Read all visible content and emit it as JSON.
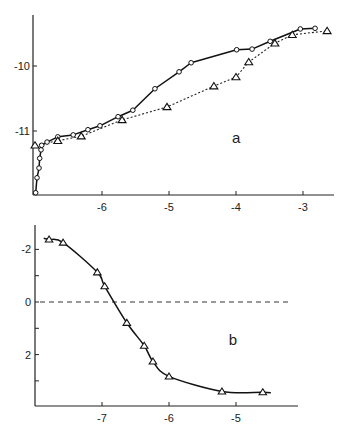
{
  "chart_data": [
    {
      "panel": "a",
      "type": "line",
      "title": "",
      "xlabel": "",
      "ylabel": "",
      "xlim": [
        -7.0,
        -2.6
      ],
      "ylim": [
        -11.95,
        -9.25
      ],
      "xticks": [
        -6,
        -5,
        -4,
        -3
      ],
      "xtick_labels": [
        "-6",
        "-5",
        "-4",
        "-3"
      ],
      "yticks": [
        -10,
        -11
      ],
      "ytick_labels": [
        "-10",
        "-11"
      ],
      "grid": false,
      "legend": null,
      "annotations": [
        {
          "text": "a",
          "x": -4.06,
          "y": -11.11
        }
      ],
      "series": [
        {
          "name": "circles (solid line)",
          "marker": "circle",
          "line": "solid",
          "x": [
            -6.99,
            -6.97,
            -6.94,
            -6.93,
            -6.91,
            -6.9,
            -6.82,
            -6.66,
            -6.43,
            -6.21,
            -6.03,
            -5.76,
            -5.54,
            -5.21,
            -4.85,
            -4.67,
            -3.99,
            -3.76,
            -3.49,
            -3.04,
            -2.82
          ],
          "y": [
            -11.95,
            -11.72,
            -11.57,
            -11.42,
            -11.29,
            -11.22,
            -11.17,
            -11.09,
            -11.06,
            -10.98,
            -10.92,
            -10.78,
            -10.68,
            -10.35,
            -10.09,
            -9.95,
            -9.75,
            -9.74,
            -9.62,
            -9.43,
            -9.42
          ]
        },
        {
          "name": "triangles (dotted line)",
          "marker": "triangle",
          "line": "dotted",
          "x": [
            -7.0,
            -6.66,
            -6.31,
            -5.7,
            -5.03,
            -4.33,
            -4.0,
            -3.81,
            -3.42,
            -3.16,
            -2.64
          ],
          "y": [
            -11.22,
            -11.15,
            -11.08,
            -10.83,
            -10.63,
            -10.31,
            -10.17,
            -9.94,
            -9.65,
            -9.52,
            -9.46
          ]
        }
      ]
    },
    {
      "panel": "b",
      "type": "line",
      "title": "",
      "xlabel": "",
      "ylabel": "",
      "xlim": [
        -8.0,
        -4.0
      ],
      "ylim": [
        3.9,
        -2.9
      ],
      "y_inverted": true,
      "xticks": [
        -7,
        -6,
        -5
      ],
      "xtick_labels": [
        "-7",
        "-6",
        "-5"
      ],
      "yticks": [
        -2,
        -1,
        0,
        1,
        2,
        3
      ],
      "ytick_labels": [
        "-2",
        "",
        "0",
        "",
        "2",
        ""
      ],
      "grid": false,
      "legend": null,
      "reference_line": {
        "y": 0,
        "style": "dashed"
      },
      "annotations": [
        {
          "text": "b",
          "x": -5.11,
          "y": 1.43
        }
      ],
      "series": [
        {
          "name": "triangles (smooth fitted curve)",
          "marker": "triangle",
          "line": "solid",
          "x": [
            -7.79,
            -7.58,
            -7.07,
            -6.96,
            -6.63,
            -6.37,
            -6.24,
            -6.0,
            -5.21,
            -4.6
          ],
          "y": [
            -2.38,
            -2.26,
            -1.13,
            -0.6,
            0.79,
            1.66,
            2.26,
            2.83,
            3.4,
            3.43
          ]
        }
      ]
    }
  ]
}
